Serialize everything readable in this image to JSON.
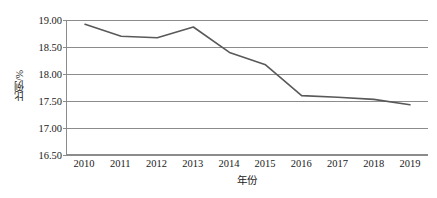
{
  "chart_data": {
    "type": "line",
    "title": "",
    "xlabel": "年份",
    "ylabel": "比例/%",
    "categories": [
      "2010",
      "2011",
      "2012",
      "2013",
      "2014",
      "2015",
      "2016",
      "2017",
      "2018",
      "2019"
    ],
    "values": [
      18.92,
      18.7,
      18.67,
      18.87,
      18.4,
      18.17,
      17.6,
      17.57,
      17.53,
      17.43
    ],
    "series": [
      {
        "name": "比例",
        "color": "#595959",
        "values": [
          18.92,
          18.7,
          18.67,
          18.87,
          18.4,
          18.17,
          17.6,
          17.57,
          17.53,
          17.43
        ]
      }
    ],
    "ylim": [
      16.5,
      19.0
    ],
    "ytick_labels": [
      "19.00",
      "18.50",
      "18.00",
      "17.50",
      "17.00",
      "16.50"
    ],
    "ytick_values": [
      19.0,
      18.5,
      18.0,
      17.5,
      17.0,
      16.5
    ],
    "xtick_labels": [
      "2010",
      "2011",
      "2012",
      "2013",
      "2014",
      "2015",
      "2016",
      "2017",
      "2018",
      "2019"
    ],
    "grid": "horizontal",
    "legend": "none",
    "markers": "none",
    "line_color": "#595959",
    "grid_color": "#8c8c8c",
    "background_color": "#ffffff"
  }
}
